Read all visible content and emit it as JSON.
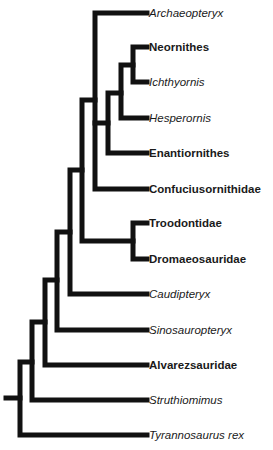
{
  "diagram": {
    "type": "cladogram",
    "line_color": "#111111",
    "taxa": [
      {
        "name": "Archaeopteryx",
        "style": "italic",
        "y": 13
      },
      {
        "name": "Neornithes",
        "style": "bold",
        "y": 47
      },
      {
        "name": "Ichthyornis",
        "style": "italic",
        "y": 82
      },
      {
        "name": "Hesperornis",
        "style": "italic",
        "y": 118
      },
      {
        "name": "Enantiornithes",
        "style": "bold",
        "y": 153
      },
      {
        "name": "Confuciusornithidae",
        "style": "bold",
        "y": 189
      },
      {
        "name": "Troodontidae",
        "style": "bold",
        "y": 223
      },
      {
        "name": "Dromaeosauridae",
        "style": "bold",
        "y": 259
      },
      {
        "name": "Caudipteryx",
        "style": "italic",
        "y": 294
      },
      {
        "name": "Sinosauropteryx",
        "style": "italic",
        "y": 330
      },
      {
        "name": "Alvarezsauridae",
        "style": "bold",
        "y": 365
      },
      {
        "name": "Struthiomimus",
        "style": "italic",
        "y": 400
      },
      {
        "name": "Tyrannosaurus rex",
        "style": "italic",
        "y": 435
      }
    ]
  }
}
